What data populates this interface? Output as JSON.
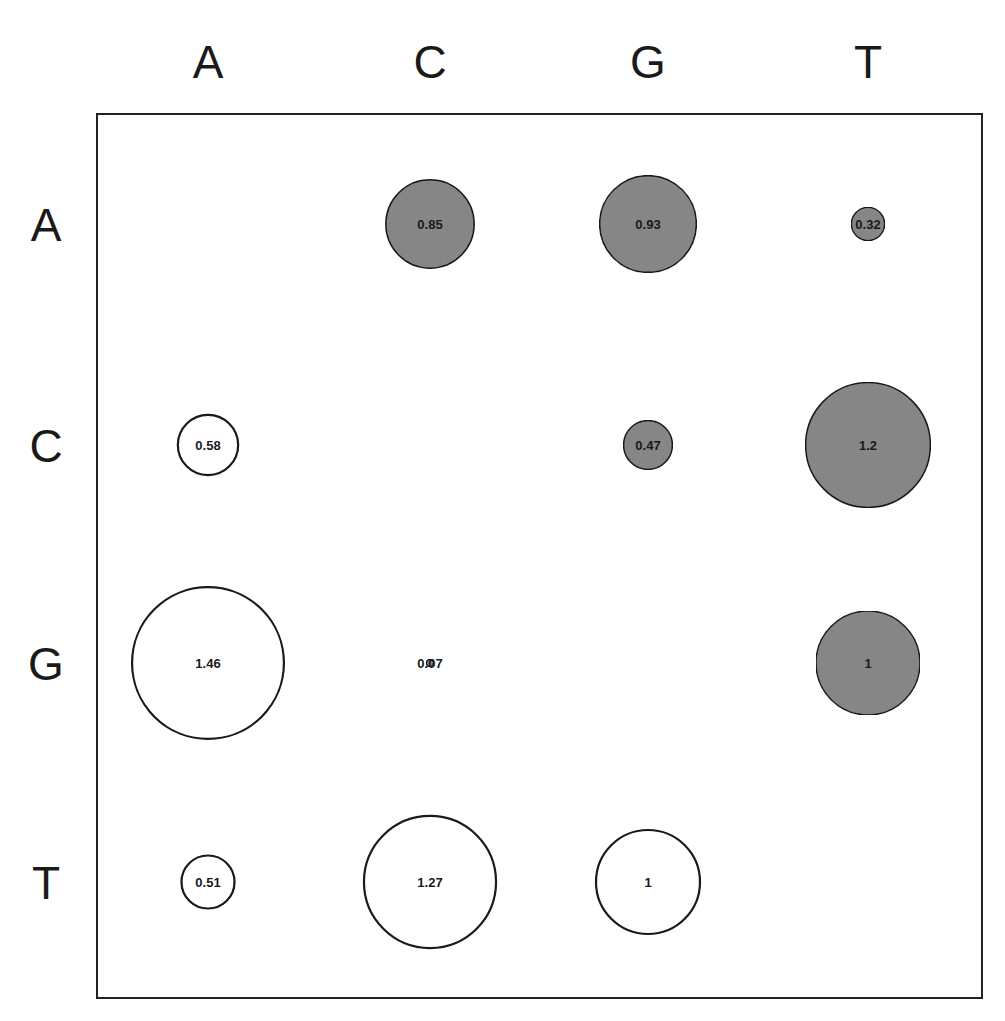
{
  "chart_data": {
    "type": "bubble-matrix",
    "title": "",
    "columns": [
      "A",
      "C",
      "G",
      "T"
    ],
    "rows": [
      "A",
      "C",
      "G",
      "T"
    ],
    "legend": "filled (grey) vs. open (white) circles; circle size proportional to value",
    "fill_colors": {
      "filled": "#8c8c8c",
      "open": "#ffffff",
      "stroke": "#1a1a1a"
    },
    "cells": [
      {
        "row": "A",
        "col": "C",
        "value": 0.85,
        "label": "0.85",
        "filled": true
      },
      {
        "row": "A",
        "col": "G",
        "value": 0.93,
        "label": "0.93",
        "filled": true
      },
      {
        "row": "A",
        "col": "T",
        "value": 0.32,
        "label": "0.32",
        "filled": true
      },
      {
        "row": "C",
        "col": "A",
        "value": 0.58,
        "label": "0.58",
        "filled": false
      },
      {
        "row": "C",
        "col": "G",
        "value": 0.47,
        "label": "0.47",
        "filled": true
      },
      {
        "row": "C",
        "col": "T",
        "value": 1.2,
        "label": "1.2",
        "filled": true
      },
      {
        "row": "G",
        "col": "A",
        "value": 1.46,
        "label": "1.46",
        "filled": false
      },
      {
        "row": "G",
        "col": "C",
        "value": 0.07,
        "label": "0.07",
        "filled": true
      },
      {
        "row": "G",
        "col": "T",
        "value": 1.0,
        "label": "1",
        "filled": true
      },
      {
        "row": "T",
        "col": "A",
        "value": 0.51,
        "label": "0.51",
        "filled": false
      },
      {
        "row": "T",
        "col": "C",
        "value": 1.27,
        "label": "1.27",
        "filled": false
      },
      {
        "row": "T",
        "col": "G",
        "value": 1.0,
        "label": "1",
        "filled": false
      }
    ],
    "grid": false
  }
}
